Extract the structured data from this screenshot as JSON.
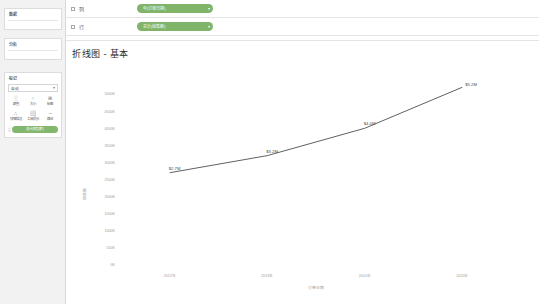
{
  "app": {
    "bg_color": "#f4f4f4",
    "accent_green": "#6aa84f"
  },
  "sidebar": {
    "data_panel": {
      "title": "数据"
    },
    "analytics_panel": {
      "title": "分析"
    },
    "marks_panel": {
      "title": "标记",
      "mark_type": {
        "label": "自动",
        "caret": "▾",
        "glyph": "⤳"
      },
      "buttons": [
        {
          "name": "color",
          "label": "颜色",
          "glyph": "░"
        },
        {
          "name": "size",
          "label": "大小",
          "glyph": "○"
        },
        {
          "name": "label",
          "label": "标签",
          "glyph": "⊞"
        },
        {
          "name": "detail",
          "label": "详细信息",
          "glyph": "∴"
        },
        {
          "name": "tooltip",
          "label": "工具提示",
          "glyph": "⬜"
        },
        {
          "name": "path",
          "label": "路径",
          "glyph": "─"
        }
      ],
      "pill": {
        "label": "总计(销售额)",
        "glyph": "░"
      }
    }
  },
  "shelves": [
    {
      "name": "columns",
      "label": "列",
      "dot": true,
      "pill": "年(订单日期)"
    },
    {
      "name": "rows",
      "label": "行",
      "dot": true,
      "pill": "总计(销售额)"
    }
  ],
  "viz": {
    "title": "折线图 - 基本"
  },
  "chart_data": {
    "type": "line",
    "title": "折线图 - 基本",
    "xlabel": "订单日期",
    "ylabel": "销售额",
    "x": [
      "2012年",
      "2013年",
      "2014年",
      "2015年"
    ],
    "categories": [
      "2012年",
      "2013年",
      "2014年",
      "2015年"
    ],
    "values": [
      2700000,
      3200000,
      4000000,
      5200000
    ],
    "point_labels": [
      "$2.7M",
      "$3.2M",
      "$4.0M",
      "$5.2M"
    ],
    "ylim": [
      0,
      5500000
    ],
    "yticks": [
      0,
      500000,
      1000000,
      1500000,
      2000000,
      2500000,
      3000000,
      3500000,
      4000000,
      4500000,
      5000000
    ],
    "ytick_labels": [
      "0K",
      "500K",
      "1000K",
      "1500K",
      "2000K",
      "2500K",
      "3000K",
      "3500K",
      "4000K",
      "4500K",
      "5000K"
    ],
    "xtick_labels": [
      "2012年",
      "2013年",
      "2014年",
      "2015年"
    ],
    "grid": false,
    "legend": null,
    "line_color": "#4e4e4e",
    "series": [
      {
        "name": "总计(销售额)",
        "values": [
          2700000,
          3200000,
          4000000,
          5200000
        ]
      }
    ]
  }
}
